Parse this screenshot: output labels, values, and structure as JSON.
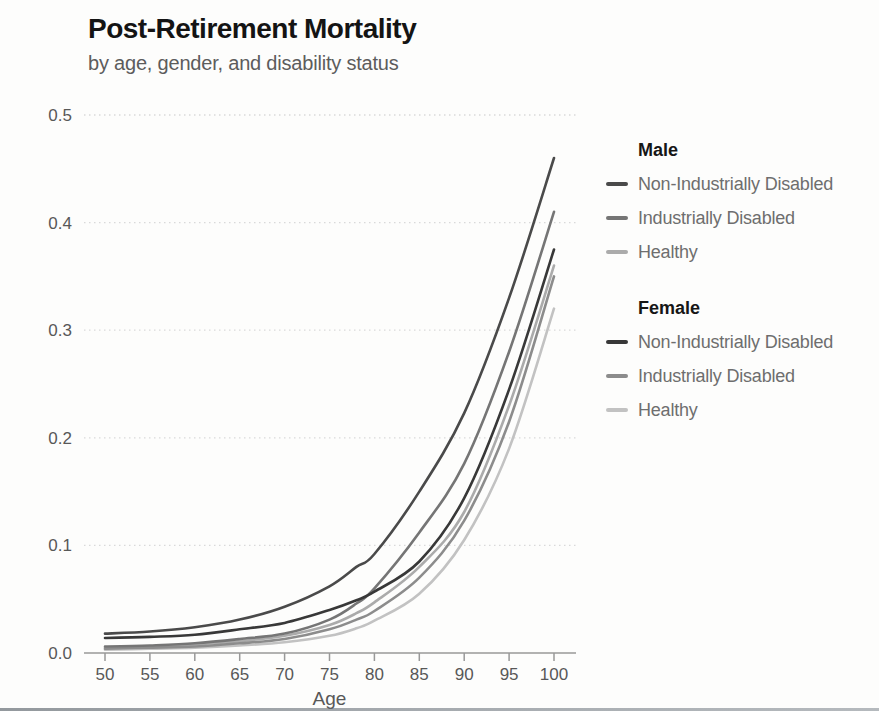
{
  "title": "Post-Retirement Mortality",
  "subtitle": "by age, gender, and disability status",
  "chart_data": {
    "type": "line",
    "title": "Post-Retirement Mortality",
    "subtitle": "by age, gender, and disability status",
    "xlabel": "Age",
    "ylabel": "",
    "xlim": [
      50,
      100
    ],
    "ylim": [
      0.0,
      0.5
    ],
    "x_ticks": [
      50,
      55,
      60,
      65,
      70,
      75,
      80,
      85,
      90,
      95,
      100
    ],
    "y_ticks": [
      0.0,
      0.1,
      0.2,
      0.3,
      0.4,
      0.5
    ],
    "y_tick_labels": [
      "0.0",
      "0.1",
      "0.2",
      "0.3",
      "0.4",
      "0.5"
    ],
    "grid": "horizontal-dotted",
    "legend_position": "right",
    "x": [
      50,
      55,
      60,
      65,
      70,
      75,
      78,
      80,
      85,
      90,
      95,
      100
    ],
    "series": [
      {
        "group": "Male",
        "label": "Non-Industrially Disabled",
        "color": "#4a4a4a",
        "values": [
          0.018,
          0.02,
          0.024,
          0.031,
          0.043,
          0.062,
          0.08,
          0.092,
          0.15,
          0.223,
          0.33,
          0.46
        ]
      },
      {
        "group": "Male",
        "label": "Industrially Disabled",
        "color": "#757575",
        "values": [
          0.006,
          0.007,
          0.009,
          0.013,
          0.018,
          0.031,
          0.046,
          0.06,
          0.112,
          0.176,
          0.28,
          0.41
        ]
      },
      {
        "group": "Male",
        "label": "Healthy",
        "color": "#ababab",
        "values": [
          0.005,
          0.006,
          0.008,
          0.011,
          0.016,
          0.026,
          0.037,
          0.047,
          0.08,
          0.131,
          0.23,
          0.36
        ]
      },
      {
        "group": "Female",
        "label": "Non-Industrially Disabled",
        "color": "#383838",
        "values": [
          0.014,
          0.015,
          0.017,
          0.022,
          0.028,
          0.04,
          0.049,
          0.057,
          0.085,
          0.144,
          0.245,
          0.375
        ]
      },
      {
        "group": "Female",
        "label": "Industrially Disabled",
        "color": "#8c8c8c",
        "values": [
          0.004,
          0.005,
          0.006,
          0.009,
          0.013,
          0.022,
          0.031,
          0.039,
          0.07,
          0.123,
          0.215,
          0.35
        ]
      },
      {
        "group": "Female",
        "label": "Healthy",
        "color": "#c2c2c2",
        "values": [
          0.003,
          0.004,
          0.005,
          0.007,
          0.01,
          0.016,
          0.023,
          0.03,
          0.055,
          0.105,
          0.19,
          0.32
        ]
      }
    ]
  },
  "legend": {
    "groups": [
      {
        "title": "Male"
      },
      {
        "title": "Female"
      }
    ]
  },
  "colors": {
    "axis": "#999999",
    "gridline": "#d9d9d9",
    "tick_text": "#585858",
    "title_text": "#141414",
    "subtitle_text": "#5c5c5c"
  }
}
